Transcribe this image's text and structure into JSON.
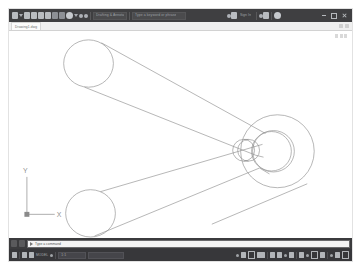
{
  "app": {
    "title": "AutoCAD",
    "accent_color": "#3f3f41",
    "canvas_color": "#ffffff",
    "geometry_color": "#8a8a8a"
  },
  "ribbon": {
    "quick_access": [
      {
        "name": "app-menu-icon",
        "glyph": "app"
      },
      {
        "name": "new-icon",
        "glyph": "sheet"
      },
      {
        "name": "open-icon",
        "glyph": "folder"
      },
      {
        "name": "save-icon",
        "glyph": "disk"
      },
      {
        "name": "saveas-icon",
        "glyph": "disk"
      },
      {
        "name": "plot-icon",
        "glyph": "printer"
      },
      {
        "name": "undo-icon",
        "glyph": "arrow"
      },
      {
        "name": "redo-icon",
        "glyph": "arrow"
      }
    ],
    "workspace_label": "Drafting & Annotation",
    "search_placeholder": "Type a keyword or phrase",
    "signin_label": "Sign In",
    "help_label": "?",
    "window_controls": [
      "minimize",
      "restore",
      "close"
    ]
  },
  "tabstrip": {
    "document_tab": "Drawing1.dwg",
    "tab_tools": [
      "layout-icon",
      "model-icon"
    ]
  },
  "canvas": {
    "ucs": {
      "x_label": "X",
      "y_label": "Y"
    },
    "model_description": "3D wireframe V-bracket: two cylindrical arms converging on a concentric circular hub"
  },
  "command_line": {
    "prompt": "Type a command",
    "buttons": [
      "customize-icon",
      "recent-icon"
    ]
  },
  "status_bar": {
    "model_label": "MODEL",
    "left_items": [
      "grid-icon",
      "snap-icon"
    ],
    "mode_labels": [
      "Layout1",
      "Layout2"
    ],
    "scale_label": "1:1",
    "coords": "",
    "right_items": [
      "grid-display-icon",
      "snap-mode-icon",
      "ortho-icon",
      "polar-icon",
      "osnap-icon",
      "otrack-icon",
      "lineweight-icon",
      "transparency-icon",
      "selection-cycling-icon",
      "annotation-scale-icon",
      "workspace-icon",
      "hardware-accel-icon",
      "isolate-icon",
      "clean-screen-icon"
    ]
  }
}
